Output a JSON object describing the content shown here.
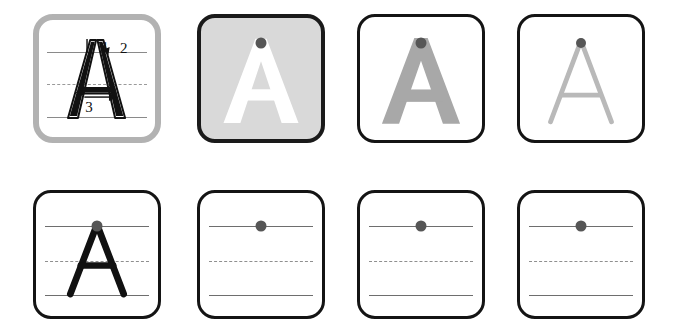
{
  "worksheet": {
    "letter": "A",
    "title": "Letter A handwriting practice worksheet",
    "rows": 2,
    "columns": 4,
    "colors": {
      "panel_border": "#141414",
      "demo_panel_border": "#b2b2b2",
      "shaded_panel_background": "#d9d9d9",
      "guideline_solid": "#6e6e6e",
      "guideline_dashed": "#8f8f8f",
      "letter_black": "#111111",
      "letter_white": "#ffffff",
      "letter_medium_gray": "#a8a8a8",
      "letter_light_gray": "#b9b9b9",
      "start_dot": "#565656"
    },
    "guidelines": {
      "top_label": "top solid line",
      "middle_label": "middle dashed line",
      "bottom_label": "bottom solid line"
    },
    "panels": [
      {
        "index": 1,
        "kind": "stroke-order-demo",
        "letter": "A",
        "letter_style": "black-outline-with-arrows",
        "has_guidelines": true,
        "has_start_dot": false,
        "stroke_numbers": [
          "1",
          "2",
          "3"
        ],
        "stroke_hints": [
          "stroke 1: down-left diagonal",
          "stroke 2: down-right diagonal",
          "stroke 3: horizontal crossbar to the right"
        ]
      },
      {
        "index": 2,
        "kind": "shaded-trace",
        "letter": "A",
        "letter_style": "white-on-gray",
        "has_guidelines": false,
        "has_start_dot": true,
        "stroke_numbers": []
      },
      {
        "index": 3,
        "kind": "gray-trace",
        "letter": "A",
        "letter_style": "medium-gray-thick",
        "has_guidelines": false,
        "has_start_dot": true,
        "stroke_numbers": []
      },
      {
        "index": 4,
        "kind": "light-trace",
        "letter": "A",
        "letter_style": "light-gray-thin",
        "has_guidelines": false,
        "has_start_dot": true,
        "stroke_numbers": []
      },
      {
        "index": 5,
        "kind": "model-on-lines",
        "letter": "A",
        "letter_style": "black-solid",
        "has_guidelines": true,
        "has_start_dot": true,
        "stroke_numbers": []
      },
      {
        "index": 6,
        "kind": "practice-blank",
        "letter": "",
        "letter_style": "none",
        "has_guidelines": true,
        "has_start_dot": true,
        "stroke_numbers": []
      },
      {
        "index": 7,
        "kind": "practice-blank",
        "letter": "",
        "letter_style": "none",
        "has_guidelines": true,
        "has_start_dot": true,
        "stroke_numbers": []
      },
      {
        "index": 8,
        "kind": "practice-blank",
        "letter": "",
        "letter_style": "none",
        "has_guidelines": true,
        "has_start_dot": true,
        "stroke_numbers": []
      }
    ]
  }
}
